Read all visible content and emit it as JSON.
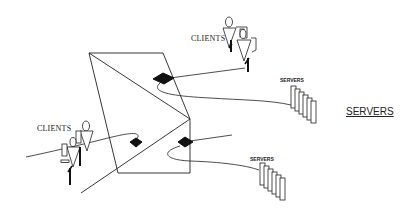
{
  "diagram": {
    "labels": {
      "clients_top": "CLIENTS",
      "clients_left": "CLIENTS",
      "servers_top": "SERVERS",
      "servers_bottom": "SERVERS",
      "servers_main": "SERVERS"
    },
    "colors": {
      "stroke": "#222222",
      "fill_node": "#111111",
      "background": "#ffffff"
    },
    "elements": {
      "client_groups": 2,
      "server_stacks": 2,
      "network_nodes": 3,
      "servers_per_stack": 5
    }
  }
}
